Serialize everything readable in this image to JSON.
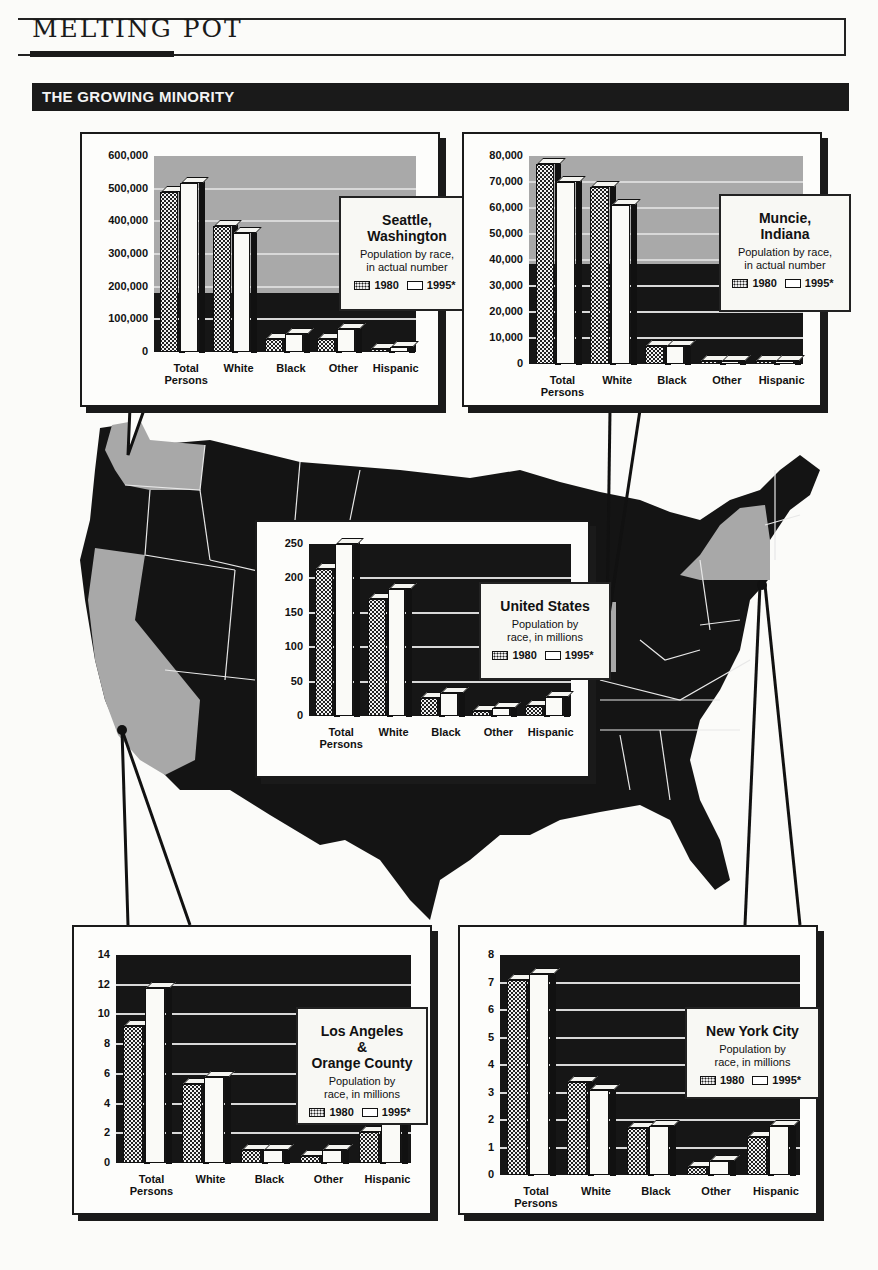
{
  "header": {
    "masthead": "MELTING POT",
    "banner": "THE GROWING MINORITY"
  },
  "colors": {
    "ink": "#1a1a1a",
    "highlight_state": "#a8a8a8",
    "paper": "#fbfbf9"
  },
  "map": {
    "description": "Map of the contiguous United States, highlighted states: Washington, California, Indiana, New York",
    "highlighted_states": [
      "Washington",
      "California",
      "Indiana",
      "New York"
    ],
    "markers": [
      "Seattle",
      "Muncie",
      "Los Angeles",
      "New York City"
    ]
  },
  "chart_data": [
    {
      "type": "bar",
      "title": "Seattle, Washington",
      "subtitle": "Population by race, in actual number",
      "categories": [
        "Total Persons",
        "White",
        "Black",
        "Other",
        "Hispanic"
      ],
      "series": [
        {
          "name": "1980",
          "values": [
            490000,
            385000,
            40000,
            40000,
            10000
          ]
        },
        {
          "name": "1995*",
          "values": [
            516000,
            365000,
            55000,
            70000,
            15000
          ]
        }
      ],
      "yticks": [
        "0",
        "100,000",
        "200,000",
        "300,000",
        "400,000",
        "500,000",
        "600,000"
      ],
      "ylim": [
        0,
        600000
      ],
      "legend": [
        "1980",
        "1995*"
      ],
      "grid": true
    },
    {
      "type": "bar",
      "title": "Muncie, Indiana",
      "subtitle": "Population by race, in actual number",
      "categories": [
        "Total Persons",
        "White",
        "Black",
        "Other",
        "Hispanic"
      ],
      "series": [
        {
          "name": "1980",
          "values": [
            77000,
            68000,
            7000,
            500,
            500
          ]
        },
        {
          "name": "1995*",
          "values": [
            70000,
            61000,
            7000,
            500,
            500
          ]
        }
      ],
      "yticks": [
        "0",
        "10,000",
        "20,000",
        "30,000",
        "40,000",
        "50,000",
        "60,000",
        "70,000",
        "80,000"
      ],
      "ylim": [
        0,
        80000
      ],
      "legend": [
        "1980",
        "1995*"
      ],
      "grid": true
    },
    {
      "type": "bar",
      "title": "United States",
      "subtitle": "Population by race, in millions",
      "categories": [
        "Total Persons",
        "White",
        "Black",
        "Other",
        "Hispanic"
      ],
      "series": [
        {
          "name": "1980",
          "values": [
            214,
            170,
            26,
            7,
            15
          ]
        },
        {
          "name": "1995*",
          "values": [
            250,
            185,
            33,
            12,
            27
          ]
        }
      ],
      "yticks": [
        "0",
        "50",
        "100",
        "150",
        "200",
        "250"
      ],
      "ylim": [
        0,
        250
      ],
      "legend": [
        "1980",
        "1995*"
      ],
      "grid": true
    },
    {
      "type": "bar",
      "title": "Los Angeles & Orange County",
      "subtitle": "Population by race, in millions",
      "categories": [
        "Total Persons",
        "White",
        "Black",
        "Other",
        "Hispanic"
      ],
      "series": [
        {
          "name": "1980",
          "values": [
            9.2,
            5.3,
            0.9,
            0.5,
            2.1
          ]
        },
        {
          "name": "1995*",
          "values": [
            11.8,
            5.8,
            0.9,
            0.9,
            3.4
          ]
        }
      ],
      "yticks": [
        "0",
        "2",
        "4",
        "6",
        "8",
        "10",
        "12",
        "14"
      ],
      "ylim": [
        0,
        14
      ],
      "legend": [
        "1980",
        "1995*"
      ],
      "grid": true
    },
    {
      "type": "bar",
      "title": "New York City",
      "subtitle": "Population by race, in millions",
      "categories": [
        "Total Persons",
        "White",
        "Black",
        "Other",
        "Hispanic"
      ],
      "series": [
        {
          "name": "1980",
          "values": [
            7.1,
            3.4,
            1.7,
            0.3,
            1.4
          ]
        },
        {
          "name": "1995*",
          "values": [
            7.3,
            3.1,
            1.8,
            0.5,
            1.8
          ]
        }
      ],
      "yticks": [
        "0",
        "1",
        "2",
        "3",
        "4",
        "5",
        "6",
        "7",
        "8"
      ],
      "ylim": [
        0,
        8
      ],
      "legend": [
        "1980",
        "1995*"
      ],
      "grid": true
    }
  ],
  "panels": [
    {
      "key": "seattle",
      "x": 80,
      "y": 132,
      "w": 360,
      "h": 275,
      "plot": {
        "x": 72,
        "y": 22,
        "w": 262,
        "h": 196
      },
      "plot_bg": "#a9a9a9",
      "legend_box": {
        "x": 185,
        "y": 40,
        "w": 136,
        "h": 115
      },
      "title_lines": [
        "Seattle,",
        "Washington"
      ],
      "sub_lines": [
        "Population by race,",
        "in actual number"
      ]
    },
    {
      "key": "muncie",
      "x": 462,
      "y": 132,
      "w": 360,
      "h": 275,
      "plot": {
        "x": 65,
        "y": 22,
        "w": 274,
        "h": 208
      },
      "plot_bg": "#a9a9a9",
      "legend_box": {
        "x": 190,
        "y": 38,
        "w": 132,
        "h": 118
      },
      "title_lines": [
        "Muncie,",
        "Indiana"
      ],
      "sub_lines": [
        "Population by race,",
        "in actual number"
      ]
    },
    {
      "key": "us",
      "x": 255,
      "y": 520,
      "w": 335,
      "h": 258,
      "plot": {
        "x": 52,
        "y": 22,
        "w": 262,
        "h": 172
      },
      "plot_bg": "#161616",
      "legend_box": {
        "x": 170,
        "y": 38,
        "w": 132,
        "h": 98
      },
      "title_lines": [
        "United States"
      ],
      "sub_lines": [
        "Population by",
        "race, in millions"
      ]
    },
    {
      "key": "la",
      "x": 72,
      "y": 925,
      "w": 360,
      "h": 290,
      "plot": {
        "x": 42,
        "y": 28,
        "w": 295,
        "h": 208
      },
      "plot_bg": "#161616",
      "legend_box": {
        "x": 180,
        "y": 52,
        "w": 132,
        "h": 118
      },
      "title_lines": [
        "Los Angeles",
        "&",
        "Orange County"
      ],
      "sub_lines": [
        "Population by",
        "race, in millions"
      ]
    },
    {
      "key": "nyc",
      "x": 458,
      "y": 925,
      "w": 360,
      "h": 290,
      "plot": {
        "x": 40,
        "y": 28,
        "w": 300,
        "h": 220
      },
      "plot_bg": "#161616",
      "legend_box": {
        "x": 185,
        "y": 52,
        "w": 135,
        "h": 92
      },
      "title_lines": [
        "New York City"
      ],
      "sub_lines": [
        "Population by",
        "race, in millions"
      ]
    }
  ]
}
